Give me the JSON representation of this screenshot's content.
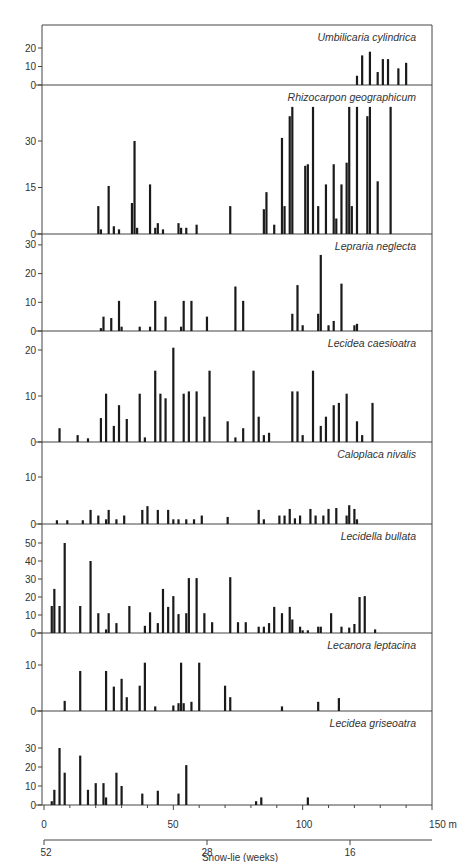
{
  "chart_data": {
    "type": "bar",
    "layout": "stacked-panels",
    "xlabel": "Snow-lie (weeks)",
    "x_axis": {
      "unit": "m",
      "range": [
        0,
        150
      ],
      "ticks": [
        0,
        50,
        100,
        150
      ],
      "tick_labels": [
        "0",
        "50",
        "100",
        "150 m"
      ],
      "minor_tick_step": 10
    },
    "secondary_x_axis": {
      "label": "Snow-lie (weeks)",
      "ticks": [
        {
          "m": 0,
          "label": "52"
        },
        {
          "m": 63,
          "label": "28"
        },
        {
          "m": 118,
          "label": "16"
        }
      ]
    },
    "grid": false,
    "panels": [
      {
        "species": "Umbilicaria cylindrica",
        "yticks": [
          0,
          10,
          20
        ],
        "ylim": [
          0,
          30
        ],
        "bars": [
          {
            "x": 121,
            "y": 5
          },
          {
            "x": 123,
            "y": 16
          },
          {
            "x": 126,
            "y": 18
          },
          {
            "x": 129,
            "y": 7
          },
          {
            "x": 131,
            "y": 14
          },
          {
            "x": 133,
            "y": 14
          },
          {
            "x": 137,
            "y": 9
          },
          {
            "x": 140,
            "y": 12
          }
        ]
      },
      {
        "species": "Rhizocarpon geographicum",
        "yticks": [
          0,
          15,
          30
        ],
        "ylim": [
          0,
          45
        ],
        "bars": [
          {
            "x": 21,
            "y": 9
          },
          {
            "x": 22,
            "y": 1.5
          },
          {
            "x": 25,
            "y": 15.5
          },
          {
            "x": 27,
            "y": 2.5
          },
          {
            "x": 29,
            "y": 1.5
          },
          {
            "x": 34,
            "y": 10
          },
          {
            "x": 35,
            "y": 30
          },
          {
            "x": 36,
            "y": 2
          },
          {
            "x": 41,
            "y": 16
          },
          {
            "x": 43,
            "y": 2
          },
          {
            "x": 44,
            "y": 3.5
          },
          {
            "x": 46,
            "y": 1.5
          },
          {
            "x": 52,
            "y": 3.5
          },
          {
            "x": 53,
            "y": 2
          },
          {
            "x": 55,
            "y": 2
          },
          {
            "x": 59,
            "y": 3
          },
          {
            "x": 72,
            "y": 9
          },
          {
            "x": 85,
            "y": 8
          },
          {
            "x": 86,
            "y": 13.5
          },
          {
            "x": 89,
            "y": 3
          },
          {
            "x": 92,
            "y": 31
          },
          {
            "x": 93,
            "y": 9
          },
          {
            "x": 95,
            "y": 38
          },
          {
            "x": 96,
            "y": 41
          },
          {
            "x": 101,
            "y": 22
          },
          {
            "x": 102,
            "y": 22.5
          },
          {
            "x": 104,
            "y": 41
          },
          {
            "x": 106,
            "y": 9
          },
          {
            "x": 109,
            "y": 16
          },
          {
            "x": 112,
            "y": 22.5
          },
          {
            "x": 113,
            "y": 5
          },
          {
            "x": 115,
            "y": 16
          },
          {
            "x": 117,
            "y": 23
          },
          {
            "x": 118,
            "y": 41
          },
          {
            "x": 119,
            "y": 9
          },
          {
            "x": 121,
            "y": 41
          },
          {
            "x": 125,
            "y": 38
          },
          {
            "x": 126,
            "y": 41
          },
          {
            "x": 129,
            "y": 17
          },
          {
            "x": 134,
            "y": 41
          }
        ]
      },
      {
        "species": "Lepraria neglecta",
        "yticks": [
          0,
          10,
          20,
          30
        ],
        "ylim": [
          0,
          33
        ],
        "bars": [
          {
            "x": 22,
            "y": 1
          },
          {
            "x": 23,
            "y": 5
          },
          {
            "x": 26,
            "y": 4.5
          },
          {
            "x": 29,
            "y": 10.5
          },
          {
            "x": 30,
            "y": 1.5
          },
          {
            "x": 37,
            "y": 1.5
          },
          {
            "x": 41,
            "y": 1.5
          },
          {
            "x": 43,
            "y": 10.5
          },
          {
            "x": 47,
            "y": 5
          },
          {
            "x": 53,
            "y": 1.5
          },
          {
            "x": 54,
            "y": 10.5
          },
          {
            "x": 57,
            "y": 10.5
          },
          {
            "x": 63,
            "y": 5
          },
          {
            "x": 74,
            "y": 15.5
          },
          {
            "x": 77,
            "y": 10.5
          },
          {
            "x": 96,
            "y": 6
          },
          {
            "x": 98,
            "y": 16
          },
          {
            "x": 100,
            "y": 2
          },
          {
            "x": 106,
            "y": 6
          },
          {
            "x": 107,
            "y": 26.5
          },
          {
            "x": 110,
            "y": 2
          },
          {
            "x": 112,
            "y": 3.5
          },
          {
            "x": 115,
            "y": 16.5
          },
          {
            "x": 120,
            "y": 2
          },
          {
            "x": 121,
            "y": 2.5
          }
        ]
      },
      {
        "species": "Lecidea caesioatra",
        "yticks": [
          0,
          10,
          20
        ],
        "ylim": [
          0,
          23
        ],
        "bars": [
          {
            "x": 6,
            "y": 3
          },
          {
            "x": 13,
            "y": 1.5
          },
          {
            "x": 17,
            "y": 0.8
          },
          {
            "x": 22,
            "y": 5.2
          },
          {
            "x": 24,
            "y": 10.5
          },
          {
            "x": 27,
            "y": 3.5
          },
          {
            "x": 29,
            "y": 8
          },
          {
            "x": 32,
            "y": 5
          },
          {
            "x": 37,
            "y": 10.5
          },
          {
            "x": 39,
            "y": 1
          },
          {
            "x": 43,
            "y": 15.5
          },
          {
            "x": 45,
            "y": 10.5
          },
          {
            "x": 47,
            "y": 9.5
          },
          {
            "x": 50,
            "y": 20.5
          },
          {
            "x": 54,
            "y": 10.5
          },
          {
            "x": 56,
            "y": 11
          },
          {
            "x": 59,
            "y": 11
          },
          {
            "x": 62,
            "y": 5.5
          },
          {
            "x": 64,
            "y": 15.5
          },
          {
            "x": 71,
            "y": 4.5
          },
          {
            "x": 74,
            "y": 1
          },
          {
            "x": 77,
            "y": 3
          },
          {
            "x": 81,
            "y": 15.5
          },
          {
            "x": 83,
            "y": 5.5
          },
          {
            "x": 85,
            "y": 1.5
          },
          {
            "x": 87,
            "y": 2
          },
          {
            "x": 96,
            "y": 11
          },
          {
            "x": 98,
            "y": 11
          },
          {
            "x": 100,
            "y": 1.5
          },
          {
            "x": 104,
            "y": 15.5
          },
          {
            "x": 107,
            "y": 3.5
          },
          {
            "x": 109,
            "y": 5.5
          },
          {
            "x": 112,
            "y": 8
          },
          {
            "x": 114,
            "y": 8.5
          },
          {
            "x": 117,
            "y": 10.5
          },
          {
            "x": 121,
            "y": 4.5
          },
          {
            "x": 123,
            "y": 1.5
          },
          {
            "x": 127,
            "y": 8.5
          }
        ]
      },
      {
        "species": "Caloplaca nivalis",
        "yticks": [
          0,
          10
        ],
        "ylim": [
          0,
          15
        ],
        "bars": [
          {
            "x": 5,
            "y": 0.8
          },
          {
            "x": 9,
            "y": 0.8
          },
          {
            "x": 15,
            "y": 0.8
          },
          {
            "x": 18,
            "y": 3
          },
          {
            "x": 21,
            "y": 1.8
          },
          {
            "x": 24,
            "y": 1
          },
          {
            "x": 25,
            "y": 3
          },
          {
            "x": 28,
            "y": 1
          },
          {
            "x": 31,
            "y": 1.8
          },
          {
            "x": 38,
            "y": 3
          },
          {
            "x": 40,
            "y": 3.8
          },
          {
            "x": 44,
            "y": 3
          },
          {
            "x": 48,
            "y": 3
          },
          {
            "x": 50,
            "y": 1
          },
          {
            "x": 52,
            "y": 1
          },
          {
            "x": 55,
            "y": 1
          },
          {
            "x": 58,
            "y": 1
          },
          {
            "x": 61,
            "y": 1.8
          },
          {
            "x": 71,
            "y": 1.5
          },
          {
            "x": 83,
            "y": 3
          },
          {
            "x": 85,
            "y": 1
          },
          {
            "x": 91,
            "y": 1.8
          },
          {
            "x": 93,
            "y": 1.8
          },
          {
            "x": 95,
            "y": 3.2
          },
          {
            "x": 97,
            "y": 1.2
          },
          {
            "x": 99,
            "y": 1.8
          },
          {
            "x": 103,
            "y": 3.2
          },
          {
            "x": 105,
            "y": 1.8
          },
          {
            "x": 108,
            "y": 1.8
          },
          {
            "x": 110,
            "y": 3.2
          },
          {
            "x": 113,
            "y": 3.4
          },
          {
            "x": 117,
            "y": 1.8
          },
          {
            "x": 118,
            "y": 4
          },
          {
            "x": 120,
            "y": 3.2
          },
          {
            "x": 121,
            "y": 1
          }
        ]
      },
      {
        "species": "Lecidella bullata",
        "yticks": [
          0,
          10,
          20,
          30,
          40,
          50
        ],
        "ylim": [
          0,
          55
        ],
        "bars": [
          {
            "x": 3,
            "y": 15
          },
          {
            "x": 4,
            "y": 24.5
          },
          {
            "x": 6,
            "y": 15
          },
          {
            "x": 8,
            "y": 50
          },
          {
            "x": 14,
            "y": 15
          },
          {
            "x": 18,
            "y": 40
          },
          {
            "x": 21,
            "y": 11
          },
          {
            "x": 24,
            "y": 2
          },
          {
            "x": 25,
            "y": 11
          },
          {
            "x": 28,
            "y": 5.5
          },
          {
            "x": 33,
            "y": 15
          },
          {
            "x": 39,
            "y": 4
          },
          {
            "x": 41,
            "y": 11.5
          },
          {
            "x": 44,
            "y": 5.5
          },
          {
            "x": 46,
            "y": 24.5
          },
          {
            "x": 48,
            "y": 14.5
          },
          {
            "x": 50,
            "y": 20.5
          },
          {
            "x": 52,
            "y": 10.5
          },
          {
            "x": 55,
            "y": 11
          },
          {
            "x": 56,
            "y": 30.5
          },
          {
            "x": 59,
            "y": 30.5
          },
          {
            "x": 62,
            "y": 11
          },
          {
            "x": 65,
            "y": 6
          },
          {
            "x": 72,
            "y": 31
          },
          {
            "x": 75,
            "y": 6
          },
          {
            "x": 78,
            "y": 6
          },
          {
            "x": 83,
            "y": 3.5
          },
          {
            "x": 85,
            "y": 3.5
          },
          {
            "x": 87,
            "y": 5.5
          },
          {
            "x": 89,
            "y": 14.5
          },
          {
            "x": 92,
            "y": 11
          },
          {
            "x": 95,
            "y": 14.5
          },
          {
            "x": 96,
            "y": 7.5
          },
          {
            "x": 99,
            "y": 3.5
          },
          {
            "x": 100,
            "y": 1.5
          },
          {
            "x": 102,
            "y": 1.5
          },
          {
            "x": 106,
            "y": 3.5
          },
          {
            "x": 107,
            "y": 3.5
          },
          {
            "x": 111,
            "y": 11
          },
          {
            "x": 115,
            "y": 3.5
          },
          {
            "x": 118,
            "y": 3
          },
          {
            "x": 120,
            "y": 5
          },
          {
            "x": 122,
            "y": 20
          },
          {
            "x": 124,
            "y": 20.5
          },
          {
            "x": 128,
            "y": 2
          }
        ]
      },
      {
        "species": "Lecanora leptacina",
        "yticks": [
          0,
          10
        ],
        "ylim": [
          0,
          15
        ],
        "bars": [
          {
            "x": 8,
            "y": 2.2
          },
          {
            "x": 14,
            "y": 8.7
          },
          {
            "x": 24,
            "y": 8.7
          },
          {
            "x": 27,
            "y": 5.3
          },
          {
            "x": 30,
            "y": 7
          },
          {
            "x": 32,
            "y": 3
          },
          {
            "x": 37,
            "y": 5.5
          },
          {
            "x": 39,
            "y": 10.5
          },
          {
            "x": 43,
            "y": 1
          },
          {
            "x": 50,
            "y": 1.2
          },
          {
            "x": 52,
            "y": 1.7
          },
          {
            "x": 53,
            "y": 10.5
          },
          {
            "x": 54,
            "y": 1.7
          },
          {
            "x": 57,
            "y": 2
          },
          {
            "x": 60,
            "y": 10.5
          },
          {
            "x": 70,
            "y": 5.5
          },
          {
            "x": 72,
            "y": 3
          },
          {
            "x": 92,
            "y": 1
          },
          {
            "x": 106,
            "y": 2
          },
          {
            "x": 114,
            "y": 2.8
          }
        ]
      },
      {
        "species": "Lecidea griseoatra",
        "yticks": [
          0,
          10,
          20,
          30
        ],
        "ylim": [
          0,
          35
        ],
        "bars": [
          {
            "x": 3,
            "y": 2
          },
          {
            "x": 4,
            "y": 8
          },
          {
            "x": 6,
            "y": 30
          },
          {
            "x": 8,
            "y": 17
          },
          {
            "x": 14,
            "y": 26
          },
          {
            "x": 17,
            "y": 8
          },
          {
            "x": 20,
            "y": 11.5
          },
          {
            "x": 23,
            "y": 11.5
          },
          {
            "x": 24,
            "y": 4
          },
          {
            "x": 28,
            "y": 17
          },
          {
            "x": 30,
            "y": 10
          },
          {
            "x": 38,
            "y": 6
          },
          {
            "x": 44,
            "y": 7.5
          },
          {
            "x": 52,
            "y": 6
          },
          {
            "x": 55,
            "y": 21
          },
          {
            "x": 82,
            "y": 2
          },
          {
            "x": 84,
            "y": 4
          },
          {
            "x": 102,
            "y": 4
          }
        ]
      }
    ]
  },
  "panels": [
    {
      "title": "Umbilicaria cylindrica"
    },
    {
      "title": "Rhizocarpon geographicum"
    },
    {
      "title": "Lepraria neglecta"
    },
    {
      "title": "Lecidea caesioatra"
    },
    {
      "title": "Caloplaca nivalis"
    },
    {
      "title": "Lecidella bullata"
    },
    {
      "title": "Lecanora leptacina"
    },
    {
      "title": "Lecidea griseoatra"
    }
  ],
  "axis": {
    "x_ticks": [
      "0",
      "50",
      "100",
      "150 m"
    ],
    "snow_ticks": [
      "52",
      "28",
      "16"
    ],
    "title": "Snow-lie (weeks)"
  },
  "style": {
    "ink": "#1a1a1a",
    "frame": "#444444",
    "background": "#ffffff"
  }
}
